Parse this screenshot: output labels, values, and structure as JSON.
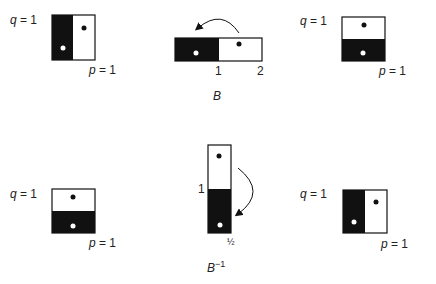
{
  "colors": {
    "ink": "#111111",
    "paper": "#ffffff",
    "text": "#222222"
  },
  "top_row": {
    "caption": "B",
    "left_square": {
      "q_label": "q = 1",
      "p_label": "p = 1",
      "split": "vertical",
      "dark_side": "left"
    },
    "middle_strip": {
      "tick_1": "1",
      "tick_2": "2",
      "arrow": "curved-arrow-left"
    },
    "right_square": {
      "q_label": "q = 1",
      "p_label": "p = 1",
      "split": "horizontal",
      "dark_side": "bottom"
    }
  },
  "bottom_row": {
    "caption_base": "B",
    "caption_sup": "−1",
    "left_square": {
      "q_label": "q = 1",
      "p_label": "p = 1",
      "split": "horizontal",
      "dark_side": "bottom"
    },
    "middle_strip": {
      "height_label": "1",
      "width_label": "½",
      "arrow": "curved-arrow-down"
    },
    "right_square": {
      "q_label": "q = 1",
      "p_label": "p = 1",
      "split": "vertical",
      "dark_side": "left"
    }
  }
}
